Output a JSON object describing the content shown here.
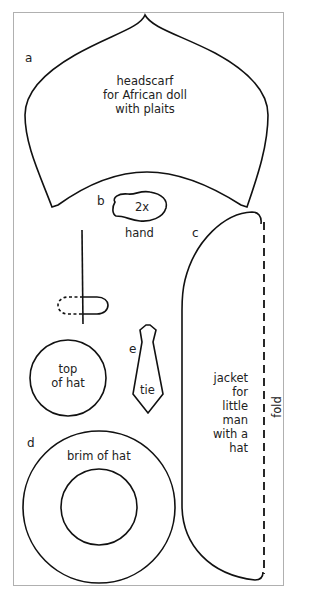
{
  "pieces": [
    {
      "letter": "a",
      "name": "headscarf",
      "label_lines": [
        "headscarf",
        "for African doll",
        "with plaits"
      ]
    },
    {
      "letter": "b",
      "name": "hand",
      "inner_label": "2x",
      "label": "hand"
    },
    {
      "letter": "c",
      "name": "jacket",
      "label_lines": [
        "jacket",
        "for",
        "little",
        "man",
        "with a",
        "hat"
      ],
      "fold_label": "fold"
    },
    {
      "letter": "d",
      "name": "hat",
      "top_label_lines": [
        "top",
        "of hat"
      ],
      "brim_label": "brim of hat"
    },
    {
      "letter": "e",
      "name": "tie",
      "label": "tie"
    }
  ],
  "colors": {
    "line": "#111111",
    "border": "#b0b0b0",
    "background": "#ffffff"
  }
}
